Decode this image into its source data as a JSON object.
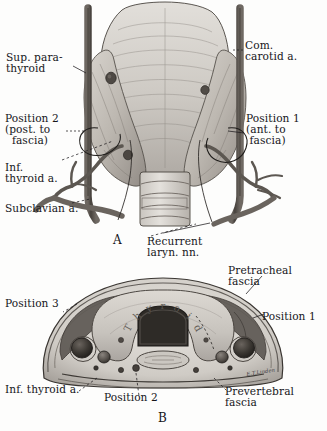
{
  "figure": {
    "title_hidden": "",
    "artist_signature": "E.T.Linden",
    "panels": [
      {
        "id": "A",
        "letter": "A",
        "view": "anterior-view-thyroid-gland"
      },
      {
        "id": "B",
        "letter": "B",
        "view": "cross-section-neck"
      }
    ]
  },
  "panel_a": {
    "letter": "A",
    "labels": {
      "sup_parathyroid": "Sup. para-\nthyroid",
      "com_carotid": "Com.\ncarotid a.",
      "position_2": "Position 2\n(post. to\n  fascia)",
      "position_1": "Position 1\n(ant. to\n fascia)",
      "inf_thyroid": "Inf.\nthyroid a.",
      "subclavian": "Subclavian a.",
      "recurrent_laryn": "Recurrent\nlaryn. nn."
    }
  },
  "panel_b": {
    "letter": "B",
    "labels": {
      "pretracheal_fascia": "Pretracheal\nfascia",
      "position_3": "Position 3",
      "position_1": "Position 1",
      "inf_thyroid": "Inf. thyroid a.",
      "position_2": "Position 2",
      "prevertebral_fascia": "Prevertebral\nfascia",
      "thyroid_curved": "Thyroid"
    },
    "thyroid_letters": [
      "T",
      "h",
      "y",
      "r",
      "o",
      "i",
      "d"
    ]
  },
  "colors": {
    "ink": "#16161a",
    "paper": "#fdfdfc",
    "tissue_light": "#d9d6d1",
    "tissue_mid": "#b4afa9",
    "tissue_dark": "#7d7771",
    "vessel_dark": "#4a4540",
    "vessel_darkest": "#2b2724",
    "leader_line": "#222226"
  }
}
